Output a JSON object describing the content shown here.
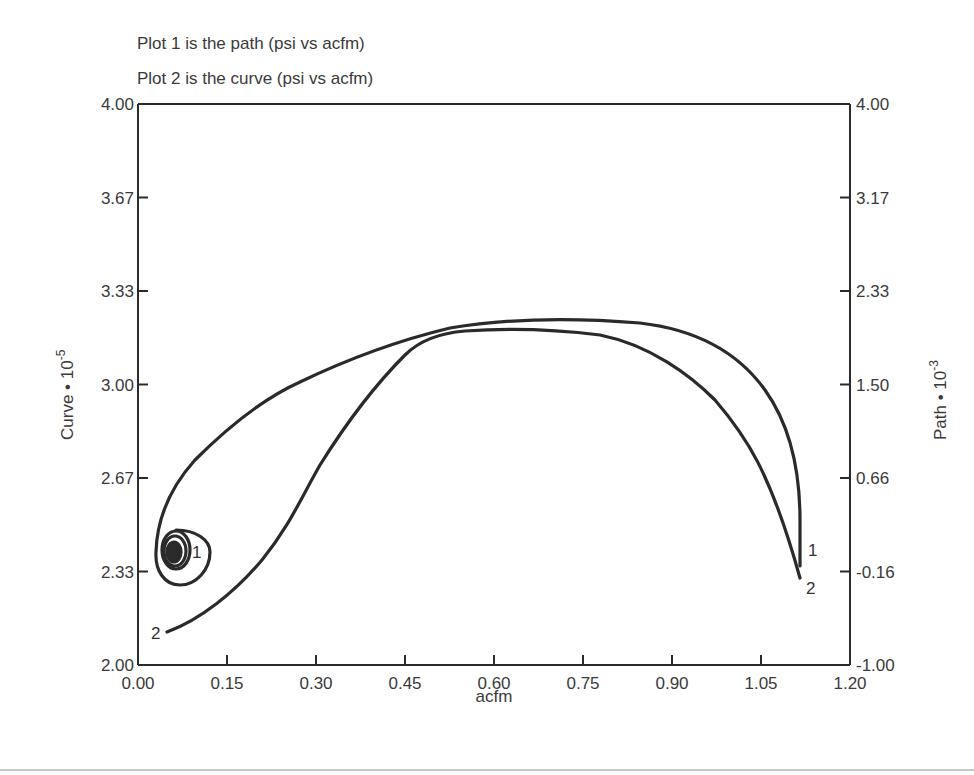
{
  "chart_data": {
    "type": "line",
    "title": "",
    "subtitles": [
      "Plot 1 is the path (psi vs acfm)",
      "Plot 2 is the curve (psi vs acfm)"
    ],
    "xlabel": "acfm",
    "ylabel_left": "Curve • 10",
    "ylabel_left_exponent": "-5",
    "ylabel_right": "Path • 10",
    "ylabel_right_exponent": "-3",
    "xlim": [
      0.0,
      1.2
    ],
    "ylim_left": [
      2.0,
      4.0
    ],
    "ylim_right": [
      -1.0,
      4.0
    ],
    "x_ticks": [
      "0.00",
      "0.15",
      "0.30",
      "0.45",
      "0.60",
      "0.75",
      "0.90",
      "1.05",
      "1.20"
    ],
    "y_ticks_left": [
      "2.00",
      "2.33",
      "2.67",
      "3.00",
      "3.33",
      "3.67",
      "4.00"
    ],
    "y_ticks_right": [
      "-1.00",
      "-0.16",
      "0.66",
      "1.50",
      "2.33",
      "3.17",
      "4.00"
    ],
    "grid": false,
    "legend": "none (curves labeled inline with 1 and 2)",
    "series": [
      {
        "name": "1",
        "description": "path (psi vs acfm)",
        "axis": "right",
        "note": "begins as a tight spiral centered near acfm 0.062, then sweeps up and right; y values below are read against left-axis scale",
        "x": [
          0.062,
          0.04,
          0.05,
          0.1,
          0.2,
          0.3,
          0.45,
          0.6,
          0.7,
          0.85,
          0.95,
          1.05,
          1.11
        ],
        "y": [
          2.39,
          2.4,
          2.5,
          2.78,
          2.98,
          3.06,
          3.17,
          3.21,
          3.2,
          3.09,
          2.9,
          2.61,
          2.38
        ]
      },
      {
        "name": "2",
        "description": "curve (psi vs acfm)",
        "axis": "left",
        "x": [
          0.05,
          0.15,
          0.25,
          0.3,
          0.4,
          0.5,
          0.6,
          0.75,
          0.9,
          1.0,
          1.11
        ],
        "y": [
          2.12,
          2.23,
          2.45,
          2.59,
          2.95,
          3.16,
          3.18,
          3.08,
          2.85,
          2.62,
          2.33
        ]
      }
    ],
    "inline_labels": [
      {
        "text": "1",
        "position": "spiral right side"
      },
      {
        "text": "2",
        "position": "left start of curve 2"
      },
      {
        "text": "1",
        "position": "right end of curve 1"
      },
      {
        "text": "2",
        "position": "right end of curve 2"
      }
    ]
  },
  "colors": {
    "line": "#2a2a2a",
    "text": "#3a3a3a",
    "background": "#ffffff",
    "rule": "#c8c8c8"
  }
}
